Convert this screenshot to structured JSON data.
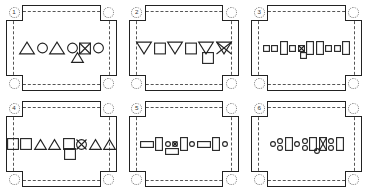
{
  "figure": {
    "type": "panel-grid",
    "columns": 3,
    "rows": 2,
    "panel_count": 6,
    "stroke_color": "#222222",
    "dash_color": "#555555",
    "background": "#ffffff"
  },
  "panels": [
    {
      "number": "1",
      "row_shapes": [
        {
          "shape": "triangle-up",
          "size": "large",
          "marked": false
        },
        {
          "shape": "circle",
          "size": "medium",
          "marked": false
        },
        {
          "shape": "triangle-up",
          "size": "large",
          "marked": false
        },
        {
          "shape": "circle",
          "size": "medium",
          "marked": false
        },
        {
          "shape": "square",
          "size": "medium",
          "marked": true
        },
        {
          "shape": "circle",
          "size": "medium",
          "marked": false
        }
      ],
      "below_shape": {
        "shape": "triangle-up",
        "size": "medium",
        "marked": false
      },
      "below_offset_pct": 72
    },
    {
      "number": "2",
      "row_shapes": [
        {
          "shape": "triangle-down",
          "size": "large",
          "marked": false
        },
        {
          "shape": "square",
          "size": "medium",
          "marked": false
        },
        {
          "shape": "triangle-down",
          "size": "large",
          "marked": false
        },
        {
          "shape": "square",
          "size": "medium",
          "marked": false
        },
        {
          "shape": "triangle-down",
          "size": "large",
          "marked": false
        },
        {
          "shape": "triangle-down",
          "size": "large",
          "marked": true
        }
      ],
      "below_shape": {
        "shape": "square",
        "size": "medium",
        "marked": false
      },
      "below_offset_pct": 84
    },
    {
      "number": "3",
      "row_shapes": [
        {
          "shape": "square",
          "size": "small",
          "marked": false
        },
        {
          "shape": "square",
          "size": "small",
          "marked": false
        },
        {
          "shape": "rect-tall",
          "size": "medium",
          "marked": false
        },
        {
          "shape": "square",
          "size": "small",
          "marked": false
        },
        {
          "shape": "square",
          "size": "small",
          "marked": true
        },
        {
          "shape": "rect-tall",
          "size": "medium",
          "marked": false
        },
        {
          "shape": "rect-tall",
          "size": "medium",
          "marked": false
        },
        {
          "shape": "square",
          "size": "small",
          "marked": false
        },
        {
          "shape": "square",
          "size": "small",
          "marked": false
        },
        {
          "shape": "rect-tall",
          "size": "medium",
          "marked": false
        }
      ],
      "below_shape": {
        "shape": "square",
        "size": "small",
        "marked": false
      },
      "below_offset_pct": 46
    },
    {
      "number": "4",
      "row_shapes": [
        {
          "shape": "square",
          "size": "medium",
          "marked": false
        },
        {
          "shape": "square",
          "size": "medium",
          "marked": false
        },
        {
          "shape": "triangle-up",
          "size": "medium",
          "marked": false
        },
        {
          "shape": "triangle-up",
          "size": "medium",
          "marked": false
        },
        {
          "shape": "square",
          "size": "medium",
          "marked": false
        },
        {
          "shape": "circle",
          "size": "medium",
          "marked": true
        },
        {
          "shape": "triangle-up",
          "size": "medium",
          "marked": false
        },
        {
          "shape": "triangle-up",
          "size": "medium",
          "marked": false
        }
      ],
      "below_shape": {
        "shape": "square",
        "size": "medium",
        "marked": false
      },
      "below_offset_pct": 62
    },
    {
      "number": "5",
      "row_shapes": [
        {
          "shape": "rect-wide",
          "size": "medium",
          "marked": false
        },
        {
          "shape": "rect-tall",
          "size": "medium",
          "marked": false
        },
        {
          "shape": "circle",
          "size": "small",
          "marked": false
        },
        {
          "shape": "circle",
          "size": "small",
          "marked": true
        },
        {
          "shape": "rect-tall",
          "size": "medium",
          "marked": false
        },
        {
          "shape": "circle",
          "size": "small",
          "marked": false
        },
        {
          "shape": "rect-wide",
          "size": "medium",
          "marked": false
        },
        {
          "shape": "rect-tall",
          "size": "medium",
          "marked": false
        },
        {
          "shape": "circle",
          "size": "small",
          "marked": false
        }
      ],
      "below_shape": {
        "shape": "rect-wide",
        "size": "medium",
        "marked": false
      },
      "below_offset_pct": 34
    },
    {
      "number": "6",
      "row_shapes": [
        {
          "shape": "circle",
          "size": "small",
          "marked": false
        },
        {
          "shape": "circle-stack2",
          "size": "small",
          "marked": false
        },
        {
          "shape": "rect-tall",
          "size": "medium",
          "marked": false
        },
        {
          "shape": "circle",
          "size": "small",
          "marked": false
        },
        {
          "shape": "circle-stack2",
          "size": "small",
          "marked": false
        },
        {
          "shape": "rect-tall",
          "size": "medium",
          "marked": false
        },
        {
          "shape": "rect-tall",
          "size": "medium",
          "marked": true
        },
        {
          "shape": "circle-stack2",
          "size": "small",
          "marked": false
        },
        {
          "shape": "rect-tall",
          "size": "medium",
          "marked": false
        }
      ],
      "below_shape": {
        "shape": "circle",
        "size": "small",
        "marked": false
      },
      "below_offset_pct": 64
    }
  ]
}
